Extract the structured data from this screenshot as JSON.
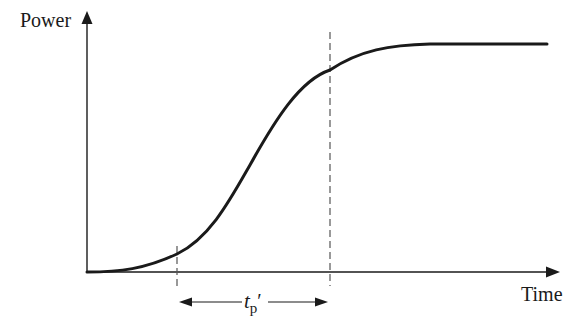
{
  "diagram": {
    "y_axis_label": "Power",
    "x_axis_label": "Time",
    "interval_label": {
      "main": "t",
      "subscript": "p",
      "prime": "′"
    },
    "colors": {
      "curve": "#1a1a1a",
      "axis": "#1a1a1a",
      "dashed": "#555555",
      "background": "#ffffff"
    },
    "curve": {
      "type": "sigmoid",
      "description": "Power rises slowly, accelerates, then saturates to a plateau over time"
    },
    "markers": [
      {
        "name": "start-of-rise",
        "style": "dashed-vertical"
      },
      {
        "name": "end-of-rise",
        "style": "dashed-vertical"
      }
    ]
  }
}
